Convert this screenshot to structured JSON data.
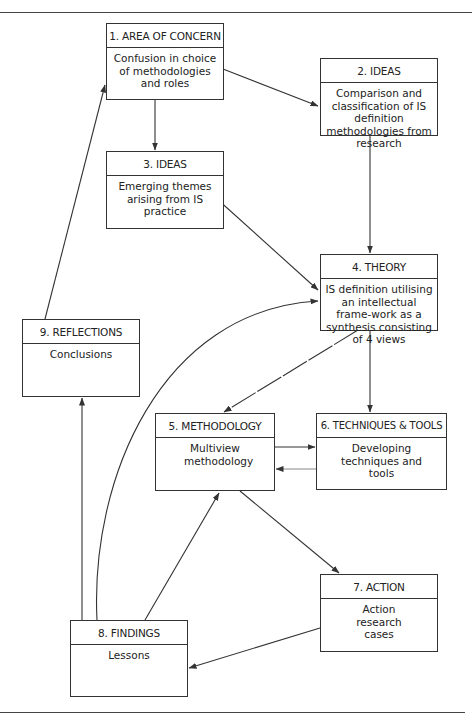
{
  "diagram": {
    "colors": {
      "line": "#333333",
      "background": "#ffffff",
      "text": "#222222"
    },
    "boxes": [
      {
        "id": "b1",
        "title": "1. AREA OF CONCERN",
        "body": "Confusion in choice of methodologies and roles"
      },
      {
        "id": "b2",
        "title": "2. IDEAS",
        "body": "Comparison and classification of IS definition methodologies from research"
      },
      {
        "id": "b3",
        "title": "3. IDEAS",
        "body": "Emerging themes arising from IS practice"
      },
      {
        "id": "b4",
        "title": "4. THEORY",
        "body": "IS definition utilising an intellectual frame-work as a synthesis consisting of 4 views"
      },
      {
        "id": "b5",
        "title": "5. METHODOLOGY",
        "body": "Multiview methodology"
      },
      {
        "id": "b6",
        "title": "6. TECHNIQUES & TOOLS",
        "body": "Developing techniques and tools"
      },
      {
        "id": "b7",
        "title": "7. ACTION",
        "body": "Action research cases"
      },
      {
        "id": "b8",
        "title": "8. FINDINGS",
        "body": "Lessons"
      },
      {
        "id": "b9",
        "title": "9. REFLECTIONS",
        "body": "Conclusions"
      }
    ],
    "edges": [
      {
        "from": "1. AREA OF CONCERN",
        "to": "2. IDEAS"
      },
      {
        "from": "1. AREA OF CONCERN",
        "to": "3. IDEAS"
      },
      {
        "from": "2. IDEAS",
        "to": "4. THEORY"
      },
      {
        "from": "3. IDEAS",
        "to": "4. THEORY"
      },
      {
        "from": "4. THEORY",
        "to": "5. METHODOLOGY"
      },
      {
        "from": "4. THEORY",
        "to": "6. TECHNIQUES & TOOLS"
      },
      {
        "from": "5. METHODOLOGY",
        "to": "6. TECHNIQUES & TOOLS"
      },
      {
        "from": "6. TECHNIQUES & TOOLS",
        "to": "5. METHODOLOGY"
      },
      {
        "from": "5. METHODOLOGY",
        "to": "7. ACTION"
      },
      {
        "from": "7. ACTION",
        "to": "8. FINDINGS"
      },
      {
        "from": "8. FINDINGS",
        "to": "5. METHODOLOGY"
      },
      {
        "from": "8. FINDINGS",
        "to": "4. THEORY"
      },
      {
        "from": "8. FINDINGS",
        "to": "9. REFLECTIONS"
      },
      {
        "from": "9. REFLECTIONS",
        "to": "1. AREA OF CONCERN"
      }
    ]
  }
}
